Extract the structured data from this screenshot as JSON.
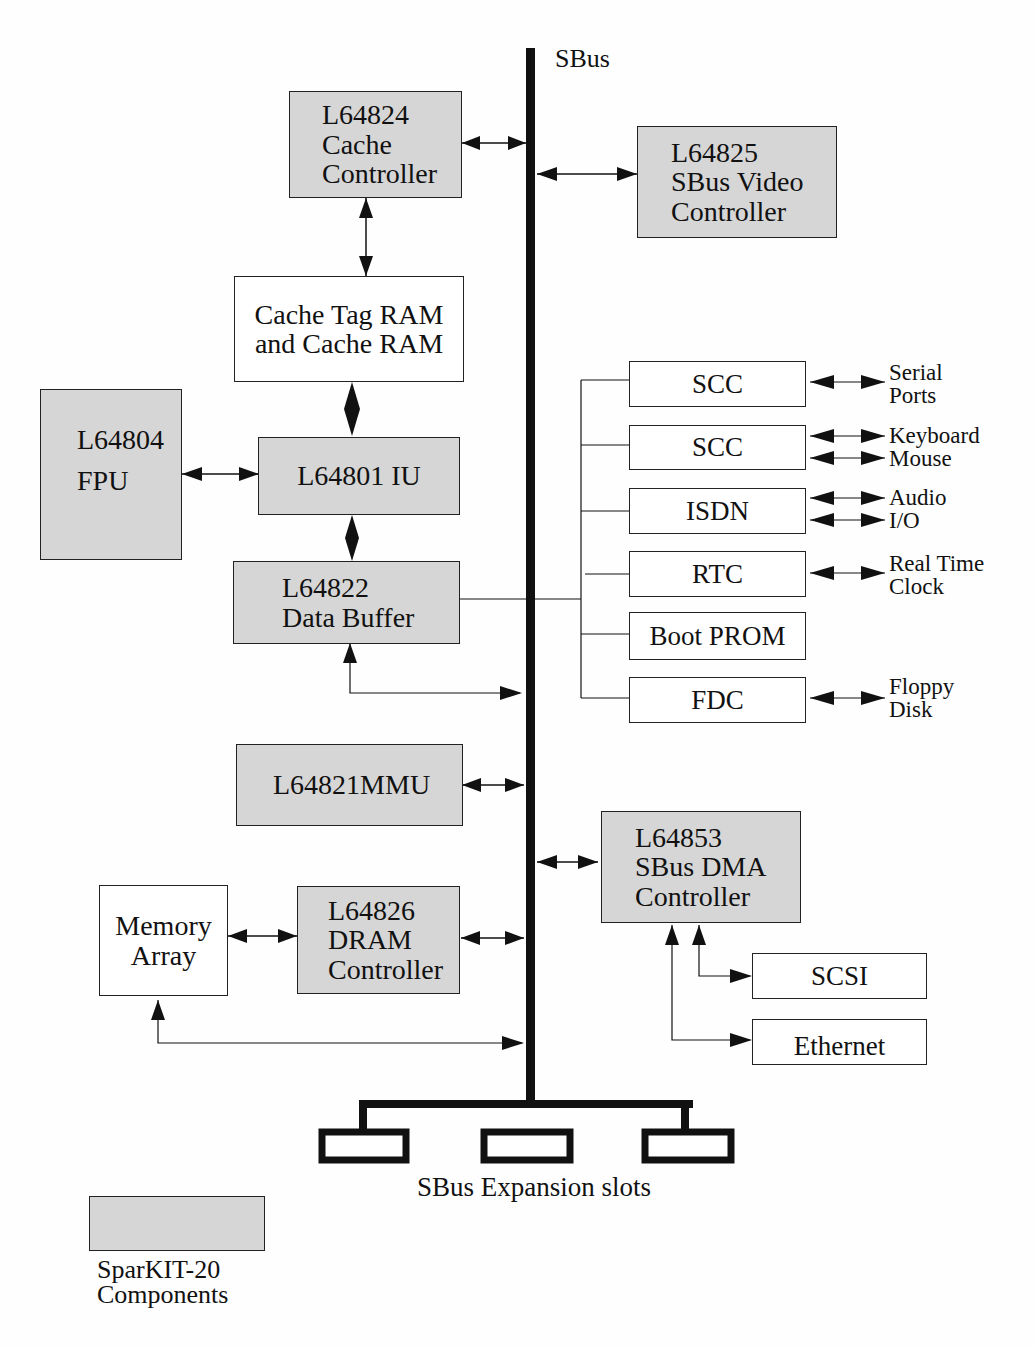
{
  "diagram": {
    "bus_label": "SBus",
    "colors": {
      "component_fill": "#d6d6d6",
      "plain_fill": "#ffffff",
      "line": "#111111"
    },
    "components": {
      "cache_controller": {
        "lines": [
          "L64824",
          "Cache",
          "Controller"
        ],
        "sparkit": true
      },
      "video_controller": {
        "lines": [
          "L64825",
          "SBus Video",
          "Controller"
        ],
        "sparkit": true
      },
      "cache_ram": {
        "lines": [
          "Cache Tag RAM",
          "and Cache RAM"
        ],
        "sparkit": false
      },
      "fpu": {
        "lines": [
          "L64804",
          "FPU"
        ],
        "sparkit": true
      },
      "iu": {
        "lines": [
          "L64801 IU"
        ],
        "sparkit": true
      },
      "data_buffer": {
        "lines": [
          "L64822",
          "Data Buffer"
        ],
        "sparkit": true
      },
      "mmu": {
        "lines": [
          "L64821MMU"
        ],
        "sparkit": true
      },
      "memory_array": {
        "lines": [
          "Memory",
          "Array"
        ],
        "sparkit": false
      },
      "dram_controller": {
        "lines": [
          "L64826",
          "DRAM",
          "Controller"
        ],
        "sparkit": true
      },
      "dma_controller": {
        "lines": [
          "L64853",
          "SBus DMA",
          "Controller"
        ],
        "sparkit": true
      },
      "scsi": {
        "lines": [
          "SCSI"
        ],
        "sparkit": false
      },
      "ethernet": {
        "lines": [
          "Ethernet"
        ],
        "sparkit": false
      }
    },
    "peripherals": [
      {
        "name": "SCC",
        "external": [
          "Serial",
          "Ports"
        ],
        "arrows": 1
      },
      {
        "name": "SCC",
        "external": [
          "Keyboard",
          "Mouse"
        ],
        "arrows": 2
      },
      {
        "name": "ISDN",
        "external": [
          "Audio",
          "I/O"
        ],
        "arrows": 2
      },
      {
        "name": "RTC",
        "external": [
          "Real Time",
          "Clock"
        ],
        "arrows": 1
      },
      {
        "name": "Boot PROM",
        "external": [],
        "arrows": 0
      },
      {
        "name": "FDC",
        "external": [
          "Floppy",
          "Disk"
        ],
        "arrows": 1
      }
    ],
    "expansion": {
      "label": "SBus Expansion slots",
      "slot_count": 3
    },
    "legend": {
      "lines": [
        "SparKIT-20",
        "Components"
      ]
    }
  }
}
